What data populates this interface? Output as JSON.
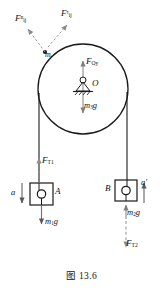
{
  "figure": {
    "caption": "图 13.6",
    "stroke_color": "#1a1a1a",
    "dashed_color": "#9a9a9a",
    "arrow_color": "#8a8a8a"
  },
  "pulley": {
    "center_label": "O",
    "axis_force_label_F": "F",
    "axis_force_sub": "Oy",
    "weight_label_m": "m",
    "weight_sub": "3",
    "weight_g": "g",
    "rim_mass_label_m": "m",
    "rim_mass_sub": "i"
  },
  "rim_forces": {
    "normal_F": "F",
    "normal_sub": "ij",
    "normal_sup": "n",
    "tangential_F": "F",
    "tangential_sub": "ij",
    "tangential_sup": "τ"
  },
  "block_a": {
    "name": "A",
    "tension_F": "F",
    "tension_sub": "T1",
    "accel_label": "a",
    "weight_m": "m",
    "weight_sub": "1",
    "weight_g": "g"
  },
  "block_b": {
    "name": "B",
    "tension_F": "F",
    "tension_sub": "T2",
    "accel_label": "a′",
    "weight_m": "m",
    "weight_sub": "2",
    "weight_g": "g"
  }
}
